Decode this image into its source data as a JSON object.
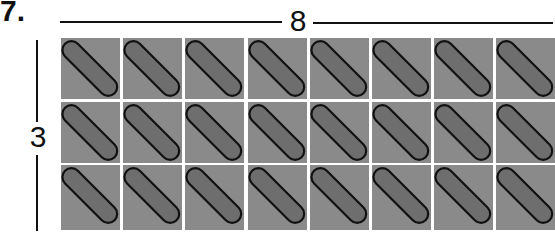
{
  "problem": {
    "number": "7."
  },
  "dimensions": {
    "width_label": "8",
    "height_label": "3"
  },
  "grid": {
    "columns": 8,
    "rows": 3,
    "tile_color": "#8a8a8a",
    "capsule_color": "#6e6e6e",
    "outline_color": "#111111",
    "tile_symbol": "diagonal-capsule"
  }
}
